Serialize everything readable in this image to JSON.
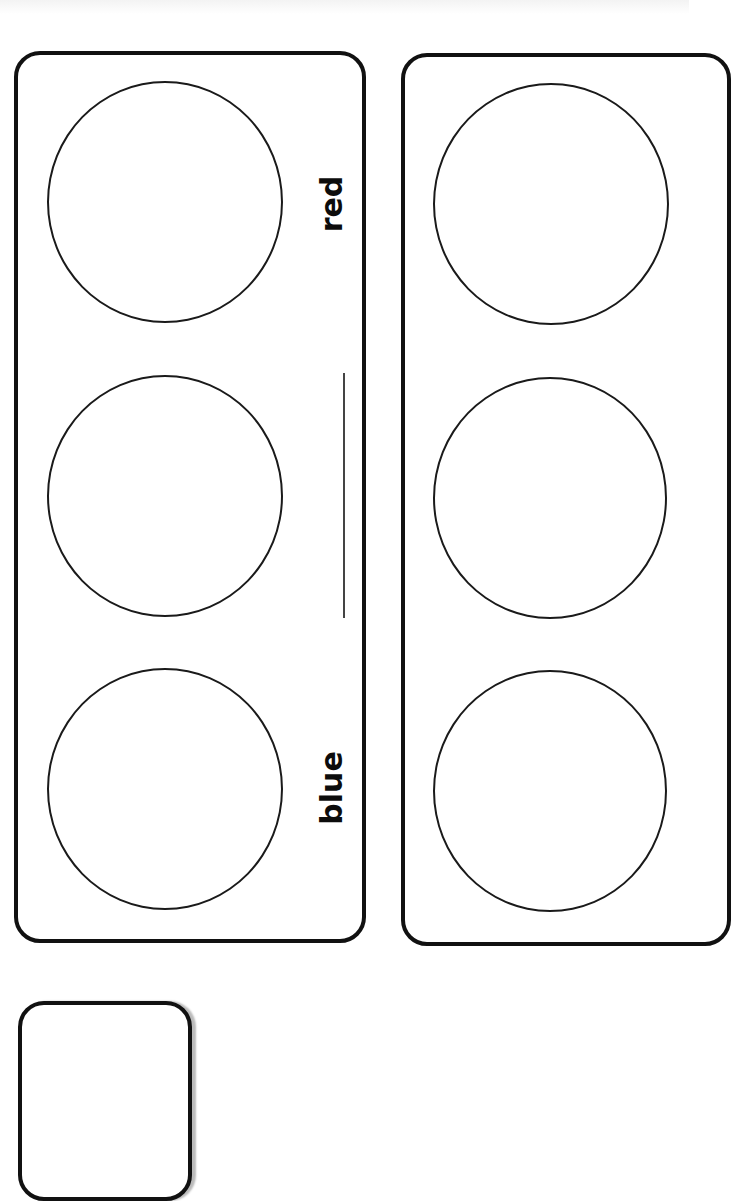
{
  "worksheet": {
    "cards": [
      {
        "labels": {
          "top": "red",
          "bottom": "blue"
        },
        "answer_line": ""
      },
      {
        "labels": {},
        "answer_line": ""
      }
    ]
  }
}
